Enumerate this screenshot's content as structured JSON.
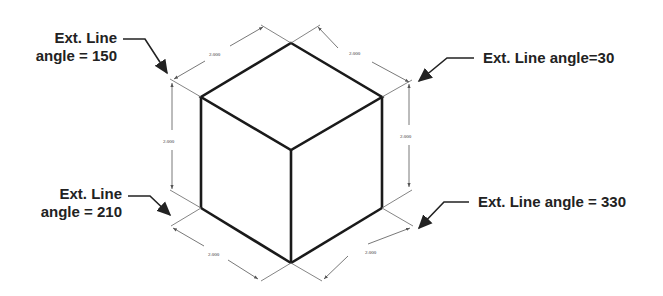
{
  "diagram": {
    "type": "isometric-cube-dimensioning",
    "colors": {
      "background": "#ffffff",
      "edge": "#1a1a1a",
      "dimension_line": "#555555",
      "label_text": "#222222"
    },
    "callouts": [
      {
        "id": "top-left",
        "line1": "Ext. Line",
        "line2": "angle = 150"
      },
      {
        "id": "top-right",
        "line1": "Ext. Line angle=30",
        "line2": ""
      },
      {
        "id": "bottom-left",
        "line1": "Ext. Line",
        "line2": "angle = 210"
      },
      {
        "id": "bottom-right",
        "line1": "Ext. Line angle = 330",
        "line2": ""
      }
    ],
    "dimensions": {
      "top_left_edge": "2.000",
      "top_right_edge": "2.000",
      "left_vertical": "2.000",
      "right_vertical": "2.000",
      "bottom_left_edge": "2.000",
      "bottom_right_edge": "2.000"
    }
  }
}
